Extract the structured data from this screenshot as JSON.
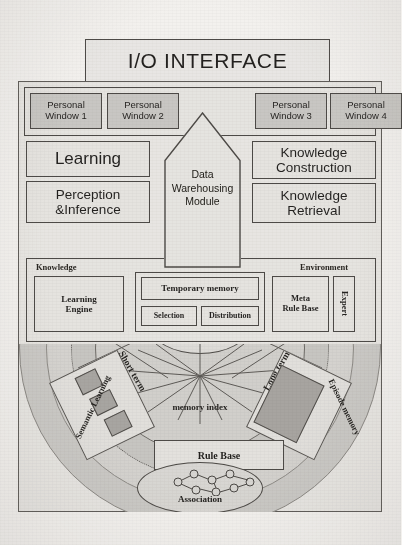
{
  "diagram": {
    "io_interface": {
      "label": "I/O INTERFACE"
    },
    "personal_windows": [
      {
        "label": "Personal\nWindow 1",
        "line1": "Personal",
        "line2": "Window 1"
      },
      {
        "label": "Personal\nWindow 2",
        "line1": "Personal",
        "line2": "Window 2"
      },
      {
        "label": "Personal\nWindow 3",
        "line1": "Personal",
        "line2": "Window 3"
      },
      {
        "label": "Personal\nWindow 4",
        "line1": "Personal",
        "line2": "Window 4"
      }
    ],
    "center_module": {
      "line1": "Data",
      "line2": "Warehousing",
      "line3": "Module"
    },
    "left_modules": [
      {
        "name": "learning",
        "label": "Learning"
      },
      {
        "name": "perception-inference",
        "line1": "Perception",
        "line2": "&Inference"
      }
    ],
    "right_modules": [
      {
        "name": "knowledge-construction",
        "line1": "Knowledge",
        "line2": "Construction"
      },
      {
        "name": "knowledge-retrieval",
        "line1": "Knowledge",
        "line2": "Retrieval"
      }
    ],
    "panel": {
      "left_label": "Knowledge",
      "right_label": "Environment",
      "learning_engine": {
        "line1": "Learning",
        "line2": "Engine"
      },
      "temporary_memory": "Temporary memory",
      "selection": "Selection",
      "distribution": "Distribution",
      "meta_rule_base": {
        "line1": "Meta",
        "line2": "Rule Base"
      },
      "expert": "Expert"
    },
    "memory_area": {
      "gate": "Gate",
      "memory_index": "memory index",
      "short_term": "Short term",
      "long_term": "Long term",
      "semantic_memory": "Semantic Learning",
      "episode_memory": "Episode memory",
      "rule_base": "Rule Base",
      "association": "Association"
    },
    "colors": {
      "paper": "#f3f1ee",
      "box_fill": "#ebe9e5",
      "window_fill": "#cdcbc7",
      "disc_outer": "#cfcdc9",
      "disc_inner": "#d9d7d3",
      "ink": "#1d1b19",
      "stroke": "#4a4743"
    }
  }
}
